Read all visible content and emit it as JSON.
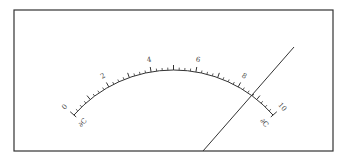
{
  "diagram": {
    "type": "meter-scale",
    "frame": {
      "x": 14,
      "y": 10,
      "width": 319,
      "height": 141
    },
    "scale": {
      "center": [
        173.5,
        202.5
      ],
      "radius": 132.5,
      "start_angle_deg": -48.7,
      "end_angle_deg": 48.7,
      "min": 0,
      "max": 10,
      "major_step": 1,
      "minor_per_major": 4,
      "labels": [
        "0",
        "2",
        "4",
        "6",
        "8",
        "10"
      ],
      "label_values": [
        0,
        2,
        4,
        6,
        8,
        10
      ],
      "left_end_label": "∂C",
      "right_end_label": "∂C"
    },
    "needle": {
      "x1": 294,
      "y1": 47,
      "x2": 203,
      "y2": 151
    },
    "colors": {
      "line": "#333333",
      "frame": "#333333",
      "text": "#444444",
      "background": "#ffffff"
    }
  }
}
